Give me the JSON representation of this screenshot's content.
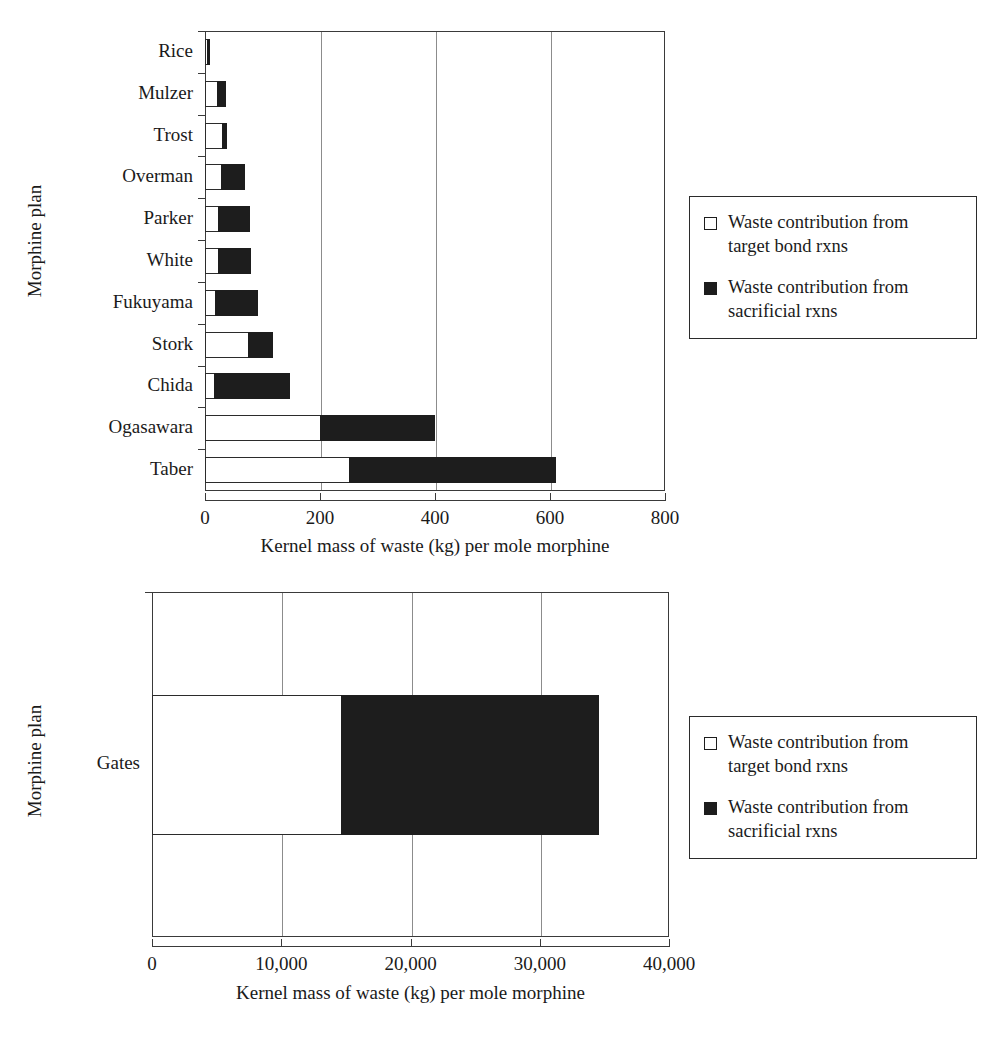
{
  "figure": {
    "background": "#ffffff",
    "bar_target_color": "#ffffff",
    "bar_sacrificial_color": "#1d1d1d",
    "axis_color": "#3a3a3a",
    "gridline_color": "#8c8c8c"
  },
  "legend": {
    "items": [
      {
        "swatch": "open-square-icon",
        "label": "Waste contribution from target bond rxns"
      },
      {
        "swatch": "filled-square-icon",
        "label": "Waste contribution from sacrificial rxns"
      }
    ]
  },
  "chart_data": [
    {
      "id": "top",
      "type": "bar",
      "orientation": "horizontal",
      "stacked": true,
      "title": "",
      "xlabel": "Kernel mass of waste (kg) per mole morphine",
      "ylabel": "Morphine plan",
      "xlim": [
        0,
        800
      ],
      "xticks": [
        0,
        200,
        400,
        600,
        800
      ],
      "xticklabels": [
        "0",
        "200",
        "400",
        "600",
        "800"
      ],
      "grid": true,
      "legend_position": "right",
      "categories": [
        "Rice",
        "Mulzer",
        "Trost",
        "Overman",
        "Parker",
        "White",
        "Fukuyama",
        "Stork",
        "Chida",
        "Ogasawara",
        "Taber"
      ],
      "series": [
        {
          "name": "Waste contribution from target bond rxns",
          "values": [
            4,
            20,
            30,
            27,
            22,
            23,
            18,
            75,
            15,
            200,
            250
          ]
        },
        {
          "name": "Waste contribution from sacrificial rxns",
          "values": [
            5,
            17,
            8,
            42,
            56,
            57,
            75,
            43,
            133,
            200,
            360
          ]
        }
      ],
      "totals": [
        9,
        37,
        38,
        69,
        78,
        80,
        93,
        118,
        148,
        400,
        610
      ]
    },
    {
      "id": "bottom",
      "type": "bar",
      "orientation": "horizontal",
      "stacked": true,
      "title": "",
      "xlabel": "Kernel mass of waste (kg) per mole morphine",
      "ylabel": "Morphine plan",
      "xlim": [
        0,
        40000
      ],
      "xticks": [
        0,
        10000,
        20000,
        30000,
        40000
      ],
      "xticklabels": [
        "0",
        "10,000",
        "20,000",
        "30,000",
        "40,000"
      ],
      "grid": true,
      "legend_position": "right",
      "categories": [
        "Gates"
      ],
      "series": [
        {
          "name": "Waste contribution from target bond rxns",
          "values": [
            14600
          ]
        },
        {
          "name": "Waste contribution from sacrificial rxns",
          "values": [
            20000
          ]
        }
      ],
      "totals": [
        34600
      ]
    }
  ]
}
